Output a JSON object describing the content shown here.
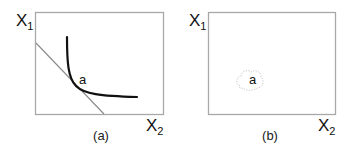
{
  "panels": [
    {
      "id": "a",
      "caption": "(a)",
      "y_axis": {
        "label": "X",
        "subscript": "1"
      },
      "x_axis": {
        "label": "X",
        "subscript": "2"
      },
      "point_label": "a",
      "elements": [
        "convex indifference curve",
        "tangent budget line touching at point a"
      ]
    },
    {
      "id": "b",
      "caption": "(b)",
      "y_axis": {
        "label": "X",
        "subscript": "1"
      },
      "x_axis": {
        "label": "X",
        "subscript": "2"
      },
      "point_label": "a",
      "elements": [
        "faint dotted cloud around point a"
      ]
    }
  ],
  "colors": {
    "frame": "#a8a8a8",
    "curve": "#111111",
    "budget_line": "#8a8a8a",
    "cloud": "#c8c8c8"
  }
}
